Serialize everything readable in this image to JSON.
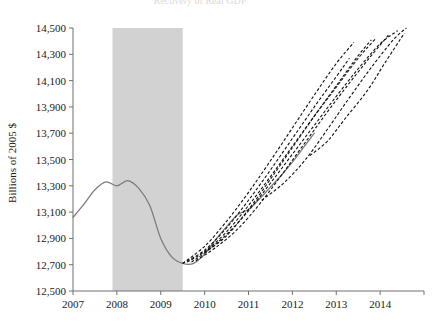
{
  "figure": {
    "title": "Recovery of Real GDP",
    "title_clipped": true,
    "background_color": "#ffffff"
  },
  "axes": {
    "y_axis_title": "Billions of 2005 $",
    "y_ticks": [
      "12,500",
      "12,700",
      "12,900",
      "13,100",
      "13,300",
      "13,500",
      "13,700",
      "13,900",
      "14,100",
      "14,300",
      "14,500"
    ],
    "x_ticks": [
      "2007",
      "2008",
      "2009",
      "2010",
      "2011",
      "2012",
      "2013",
      "2014"
    ],
    "axis_color": "#707070"
  },
  "legend": {
    "actual_label": "Actual",
    "forecast_label": "Forecast vintages",
    "recession_label": "Recession"
  },
  "colors": {
    "actual_line": "#7a7a7a",
    "forecast_line": "#111111",
    "recession_shading": "#d2d2d2"
  },
  "chart_data": {
    "type": "line",
    "title": "Recovery of Real GDP",
    "xlabel": "",
    "ylabel": "Billions of 2005 $",
    "xlim": [
      2007.0,
      2015.0
    ],
    "ylim": [
      12500,
      14500
    ],
    "ytick_step": 200,
    "grid": false,
    "legend_position": "none",
    "recession_band": {
      "start": 2007.9,
      "end": 2009.5,
      "color": "#d2d2d2"
    },
    "series": [
      {
        "name": "Actual real GDP",
        "style": "solid",
        "color": "#7a7a7a",
        "x": [
          2007.0,
          2007.25,
          2007.5,
          2007.75,
          2008.0,
          2008.25,
          2008.5,
          2008.75,
          2009.0,
          2009.25,
          2009.5,
          2009.75,
          2010.0,
          2010.25,
          2010.5,
          2010.75,
          2011.0,
          2011.25,
          2011.5,
          2011.75,
          2012.0,
          2012.25,
          2012.5
        ],
        "y": [
          13060,
          13160,
          13270,
          13330,
          13300,
          13340,
          13280,
          13150,
          12900,
          12760,
          12710,
          12710,
          12780,
          12890,
          12990,
          13080,
          13120,
          13200,
          13290,
          13380,
          13480,
          13590,
          13700
        ]
      },
      {
        "name": "Forecast vintage 1",
        "style": "dashed",
        "color": "#111111",
        "x": [
          2009.5,
          2010.0,
          2010.5,
          2011.0,
          2011.5,
          2012.0,
          2012.5,
          2013.0,
          2013.4
        ],
        "y": [
          12710,
          12840,
          13030,
          13250,
          13490,
          13740,
          13990,
          14230,
          14390
        ]
      },
      {
        "name": "Forecast vintage 2",
        "style": "dashed",
        "color": "#111111",
        "x": [
          2009.5,
          2010.0,
          2010.5,
          2011.0,
          2011.5,
          2012.0,
          2012.5,
          2013.0,
          2013.3
        ],
        "y": [
          12710,
          12810,
          12980,
          13190,
          13420,
          13660,
          13900,
          14130,
          14270
        ]
      },
      {
        "name": "Forecast vintage 3",
        "style": "dashed",
        "color": "#111111",
        "x": [
          2009.6,
          2010.0,
          2010.5,
          2011.0,
          2011.5,
          2012.0,
          2012.5,
          2013.0,
          2013.5,
          2013.9
        ],
        "y": [
          12720,
          12800,
          12950,
          13150,
          13370,
          13600,
          13830,
          14050,
          14270,
          14420
        ]
      },
      {
        "name": "Forecast vintage 4",
        "style": "dashed",
        "color": "#111111",
        "x": [
          2009.7,
          2010.0,
          2010.5,
          2011.0,
          2011.5,
          2012.0,
          2012.5,
          2013.0,
          2013.5,
          2014.0,
          2014.4
        ],
        "y": [
          12720,
          12790,
          12930,
          13110,
          13320,
          13540,
          13760,
          13980,
          14190,
          14380,
          14480
        ]
      },
      {
        "name": "Forecast vintage 5",
        "style": "dashed",
        "color": "#111111",
        "x": [
          2009.8,
          2010.25,
          2010.75,
          2011.25,
          2011.75,
          2012.25,
          2012.75,
          2013.25,
          2013.75,
          2014.2
        ],
        "y": [
          12730,
          12830,
          12970,
          13160,
          13380,
          13610,
          13840,
          14060,
          14270,
          14450
        ]
      },
      {
        "name": "Forecast vintage 6",
        "style": "dashed",
        "color": "#111111",
        "x": [
          2010.0,
          2010.5,
          2011.0,
          2011.5,
          2012.0,
          2012.5,
          2013.0,
          2013.5,
          2013.8
        ],
        "y": [
          12790,
          12920,
          13120,
          13350,
          13590,
          13830,
          14060,
          14290,
          14410
        ]
      },
      {
        "name": "Forecast vintage 7",
        "style": "dashed",
        "color": "#111111",
        "x": [
          2011.3,
          2011.8,
          2012.3,
          2012.8,
          2013.3,
          2013.8,
          2014.3,
          2014.6
        ],
        "y": [
          13190,
          13320,
          13500,
          13730,
          13970,
          14200,
          14410,
          14500
        ]
      },
      {
        "name": "Forecast vintage 8",
        "style": "dashed",
        "color": "#111111",
        "x": [
          2012.4,
          2012.8,
          2013.2,
          2013.7,
          2014.1,
          2014.55
        ],
        "y": [
          13530,
          13640,
          13810,
          14020,
          14230,
          14460
        ]
      }
    ]
  }
}
